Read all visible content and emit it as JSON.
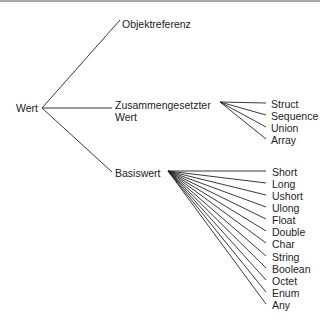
{
  "tree": {
    "root": {
      "label": "Wert",
      "x": 16,
      "y": 102,
      "vx": 42,
      "vy": 108
    },
    "level1": [
      {
        "label": "Objektreferenz",
        "x": 122,
        "y": 18,
        "ex": 120,
        "ey": 20
      },
      {
        "label": "Zusammengesetzter",
        "label2": "Wert",
        "x": 115,
        "y": 97,
        "ex": 112,
        "ey": 108
      },
      {
        "label": "Basiswert",
        "x": 115,
        "y": 168,
        "ex": 112,
        "ey": 172
      }
    ],
    "composite_children": {
      "vertex": [
        220,
        102
      ],
      "items": [
        "Struct",
        "Sequence",
        "Union",
        "Array"
      ]
    },
    "basic_children": {
      "vertex": [
        168,
        171
      ],
      "items": [
        "Short",
        "Long",
        "Ushort",
        "Ulong",
        "Float",
        "Double",
        "Char",
        "String",
        "Boolean",
        "Octet",
        "Enum",
        "Any"
      ]
    }
  }
}
